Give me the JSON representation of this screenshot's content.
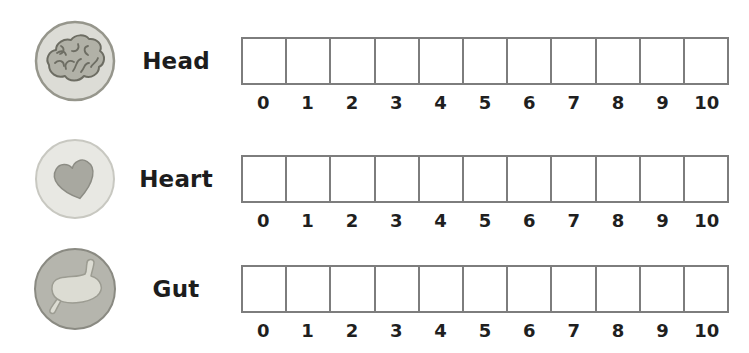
{
  "colors": {
    "background": "#ffffff",
    "box_border": "#7d7d7d",
    "label_text": "#1d1d1d",
    "tick_text": "#1f1f1f"
  },
  "scale": {
    "min": 0,
    "max": 10,
    "ticks": [
      "0",
      "1",
      "2",
      "3",
      "4",
      "5",
      "6",
      "7",
      "8",
      "9",
      "10"
    ]
  },
  "rows": [
    {
      "label": "Head",
      "icon": "brain-icon"
    },
    {
      "label": "Heart",
      "icon": "heart-icon"
    },
    {
      "label": "Gut",
      "icon": "gut-icon"
    }
  ]
}
